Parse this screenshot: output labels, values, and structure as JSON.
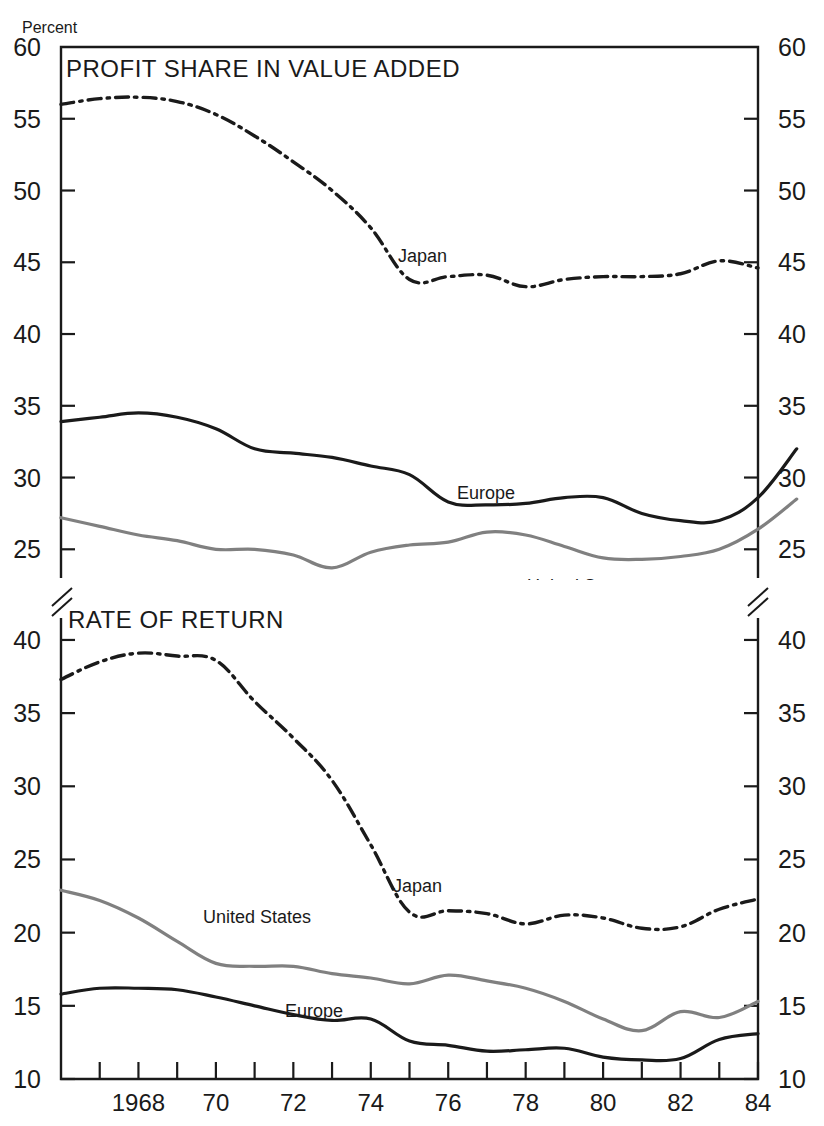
{
  "figure": {
    "unit_label": "Percent",
    "background": "#ffffff"
  },
  "panels": {
    "top": {
      "title": "PROFIT SHARE IN VALUE ADDED",
      "y_ticks": [
        60,
        55,
        50,
        45,
        40,
        35,
        30,
        25
      ],
      "y_min": 23.0,
      "y_max": 60.0,
      "series_labels": {
        "japan": "Japan",
        "europe": "Europe",
        "united_states": "United States"
      }
    },
    "bottom": {
      "title": "RATE OF RETURN",
      "y_ticks": [
        40,
        35,
        30,
        25,
        20,
        15,
        10
      ],
      "y_min": 10.0,
      "y_max": 41.5,
      "series_labels": {
        "japan": "Japan",
        "europe": "Europe",
        "united_states": "United States"
      }
    }
  },
  "x_axis": {
    "labeled_ticks": [
      "1968",
      "70",
      "72",
      "74",
      "76",
      "78",
      "80",
      "82",
      "84"
    ],
    "labeled_years": [
      1968,
      1970,
      1972,
      1974,
      1976,
      1978,
      1980,
      1982,
      1984
    ],
    "x_min": 1966,
    "x_max": 1984
  },
  "colors": {
    "japan": "#1a1a1a",
    "europe": "#1a1a1a",
    "united_states": "#808080",
    "axis": "#1a1a1a"
  },
  "chart_data": [
    {
      "type": "line",
      "title": "PROFIT SHARE IN VALUE ADDED",
      "xlabel": "",
      "ylabel": "Percent",
      "xlim": [
        1966,
        1984
      ],
      "ylim": [
        23.0,
        60.0
      ],
      "grid": false,
      "legend": "inline-labels",
      "x": [
        1966,
        1967,
        1968,
        1969,
        1970,
        1971,
        1972,
        1973,
        1974,
        1975,
        1976,
        1977,
        1978,
        1979,
        1980,
        1981,
        1982,
        1983,
        1984
      ],
      "series": [
        {
          "name": "Japan",
          "style": "dash-dot",
          "color": "#1a1a1a",
          "values": [
            56.0,
            56.4,
            56.5,
            56.2,
            55.3,
            53.8,
            52.0,
            50.0,
            47.4,
            43.8,
            44.0,
            44.1,
            43.3,
            43.8,
            44.0,
            44.0,
            44.2,
            45.1,
            44.6
          ]
        },
        {
          "name": "Europe",
          "style": "solid",
          "color": "#1a1a1a",
          "values": [
            33.9,
            34.2,
            34.5,
            34.2,
            33.4,
            32.0,
            31.7,
            31.4,
            30.8,
            30.2,
            28.3,
            28.1,
            28.2,
            28.6,
            28.6,
            27.5,
            27.0,
            27.0,
            28.6,
            32.0
          ]
        },
        {
          "name": "United States",
          "style": "solid",
          "color": "#808080",
          "values": [
            27.2,
            26.6,
            26.0,
            25.6,
            25.0,
            25.0,
            24.6,
            23.7,
            24.8,
            25.3,
            25.5,
            26.2,
            26.0,
            25.2,
            24.4,
            24.3,
            24.5,
            25.0,
            26.4,
            28.5
          ]
        }
      ]
    },
    {
      "type": "line",
      "title": "RATE OF RETURN",
      "xlabel": "",
      "ylabel": "Percent",
      "xlim": [
        1966,
        1984
      ],
      "ylim": [
        10.0,
        41.5
      ],
      "grid": false,
      "legend": "inline-labels",
      "x": [
        1966,
        1967,
        1968,
        1969,
        1970,
        1971,
        1972,
        1973,
        1974,
        1975,
        1976,
        1977,
        1978,
        1979,
        1980,
        1981,
        1982,
        1983,
        1984
      ],
      "series": [
        {
          "name": "Japan",
          "style": "dash-dot",
          "color": "#1a1a1a",
          "values": [
            37.3,
            38.5,
            39.1,
            38.9,
            38.6,
            35.8,
            33.3,
            30.4,
            26.0,
            21.4,
            21.5,
            21.3,
            20.6,
            21.2,
            21.0,
            20.3,
            20.4,
            21.6,
            22.3
          ]
        },
        {
          "name": "Europe",
          "style": "solid",
          "color": "#1a1a1a",
          "values": [
            15.8,
            16.2,
            16.2,
            16.1,
            15.6,
            15.0,
            14.4,
            14.0,
            14.1,
            12.6,
            12.3,
            11.9,
            12.0,
            12.1,
            11.5,
            11.3,
            11.4,
            12.7,
            13.1
          ]
        },
        {
          "name": "United States",
          "style": "solid",
          "color": "#808080",
          "values": [
            22.9,
            22.2,
            21.0,
            19.4,
            17.9,
            17.7,
            17.7,
            17.2,
            16.9,
            16.5,
            17.1,
            16.7,
            16.2,
            15.3,
            14.1,
            13.3,
            14.6,
            14.2,
            15.3
          ]
        }
      ]
    }
  ]
}
